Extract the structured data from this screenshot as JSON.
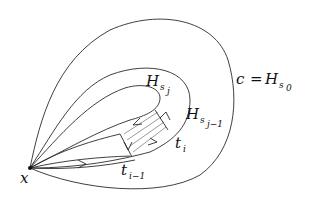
{
  "diagram": {
    "type": "homotopy-figure",
    "labels": {
      "base_point": "x",
      "outer_curve_lhs": "c",
      "outer_curve_eq": "=",
      "outer_curve_H": "H",
      "outer_curve_sub": "s",
      "outer_curve_subsub": "0",
      "inner_curve_H": "H",
      "inner_curve_sub": "s",
      "inner_curve_subsub": "j",
      "middle_curve_H": "H",
      "middle_curve_sub": "s",
      "middle_curve_subsub": "j−1",
      "t_i_main": "t",
      "t_i_sub": "i",
      "t_im1_main": "t",
      "t_im1_sub": "i−1"
    },
    "colors": {
      "stroke": "#2a2a2a",
      "background": "#ffffff"
    }
  }
}
